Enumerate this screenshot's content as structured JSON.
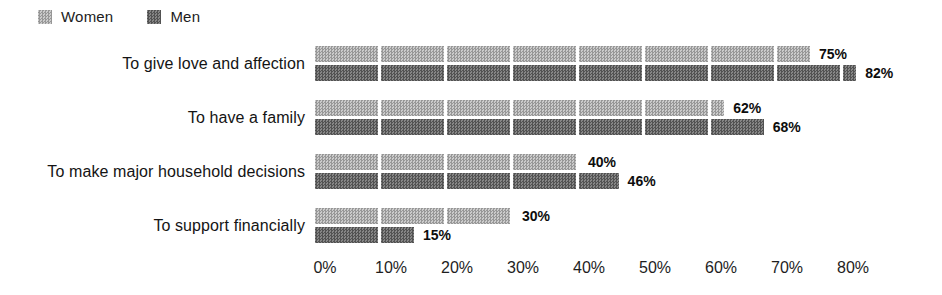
{
  "chart_data": {
    "type": "bar",
    "orientation": "horizontal",
    "title": "",
    "categories": [
      "To give love and affection",
      "To have a family",
      "To make major household decisions",
      "To support financially"
    ],
    "series": [
      {
        "name": "Women",
        "values": [
          75,
          62,
          40,
          30
        ]
      },
      {
        "name": "Men",
        "values": [
          82,
          68,
          46,
          15
        ]
      }
    ],
    "value_label_suffix": "%",
    "x_axis": {
      "min": 0,
      "max": 80,
      "tick_step": 10,
      "ticks": [
        "0%",
        "10%",
        "20%",
        "30%",
        "40%",
        "50%",
        "60%",
        "70%",
        "80%"
      ]
    },
    "legend": {
      "position": "top-left",
      "items": [
        "Women",
        "Men"
      ]
    },
    "grid": false,
    "bar_segments": "white gap every 10%"
  },
  "colors": {
    "background": "#ffffff",
    "women_checker_light": "#cbcbcb",
    "women_checker_dark": "#979797",
    "men_checker_light": "#868686",
    "men_checker_dark": "#525252",
    "segment_gap": "#ffffff",
    "text": "#1c1c1c"
  },
  "layout": {
    "px_per_percent": 6.6,
    "plot_left_px": 325
  }
}
